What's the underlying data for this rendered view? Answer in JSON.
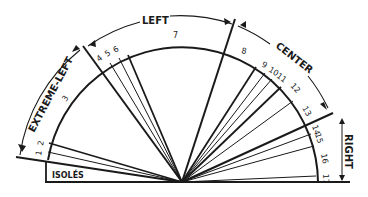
{
  "diagram": {
    "center": {
      "x": 182,
      "y": 182
    },
    "inner_radius": 136,
    "outer_radius": 165,
    "line_color": "#1a1a1a",
    "background": "#ffffff",
    "sectors": [
      {
        "label": "EXTREME-LEFT",
        "from_angle": 172,
        "to_angle": 122
      },
      {
        "label": "LEFT",
        "from_angle": 122,
        "to_angle": 74
      },
      {
        "label": "CENTER",
        "from_angle": 74,
        "to_angle": 22
      },
      {
        "label": "RIGHT",
        "from_angle": 22,
        "to_angle": 0
      }
    ],
    "isoles_label": "ISOLÉS",
    "seat_numbers": [
      "1",
      "2",
      "3",
      "4",
      "5",
      "6",
      "7",
      "8",
      "9",
      "10",
      "11",
      "12",
      "13",
      "14",
      "15",
      "16",
      "17"
    ]
  }
}
